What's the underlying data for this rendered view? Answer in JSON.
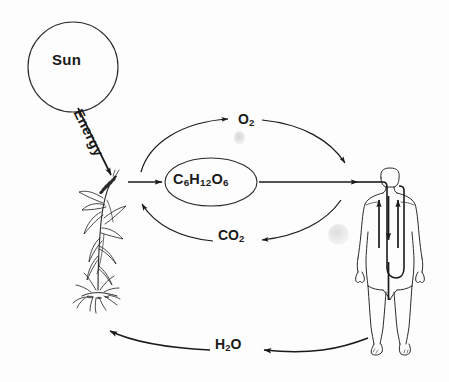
{
  "diagram": {
    "background_color": "#fdfdfd",
    "stroke_color": "#1a1a1a",
    "nodes": {
      "sun": {
        "label": "Sun",
        "shape": "circle",
        "cx": 73,
        "cy": 67,
        "r": 45
      },
      "plant": {
        "label": "plant",
        "shape": "illustration-wheat-plant",
        "x": 72,
        "y": 175,
        "width": 48,
        "height": 135
      },
      "glucose": {
        "label_text": "C",
        "sub1": "6",
        "mid1": "H",
        "sub2": "12",
        "mid2": "O",
        "sub3": "6",
        "full": "C6H12O6",
        "shape": "ellipse",
        "cx": 211,
        "cy": 182,
        "rx": 46,
        "ry": 24
      },
      "human": {
        "label": "human",
        "shape": "illustration-human-body",
        "x": 360,
        "y": 168,
        "width": 60,
        "height": 172
      }
    },
    "edges": [
      {
        "name": "sun-to-plant",
        "label": "Energy",
        "from": "sun",
        "to": "plant",
        "style": "straight-arrow",
        "direction": "down-right"
      },
      {
        "name": "plant-to-glucose",
        "label": "",
        "from": "plant",
        "to": "glucose",
        "style": "straight-arrow",
        "direction": "right"
      },
      {
        "name": "glucose-to-human",
        "label": "",
        "from": "glucose",
        "to": "human",
        "style": "straight-arrow",
        "direction": "right"
      },
      {
        "name": "oxygen-arc",
        "label": "O2",
        "from": "plant",
        "to": "human",
        "style": "curved-arc",
        "direction": "clockwise-upper"
      },
      {
        "name": "carbon-dioxide-arc",
        "label": "CO2",
        "from": "human",
        "to": "plant",
        "style": "curved-arc",
        "direction": "counterclockwise-lower"
      },
      {
        "name": "water-arc",
        "label": "H2O",
        "from": "human",
        "to": "plant",
        "style": "curved-arc",
        "direction": "right-to-left-bottom"
      }
    ],
    "labels": {
      "sun": "Sun",
      "energy": "Energy",
      "oxygen": {
        "base": "O",
        "sub": "2"
      },
      "carbon_dioxide": {
        "base": "CO",
        "sub": "2"
      },
      "water": {
        "base": "H",
        "sub": "2",
        "tail": "O"
      },
      "glucose": {
        "c": "C",
        "c_sub": "6",
        "h": "H",
        "h_sub": "12",
        "o": "O",
        "o_sub": "6"
      }
    },
    "artifacts": [
      {
        "name": "smudge-upper",
        "type": "scan-artifact"
      },
      {
        "name": "smudge-lower",
        "type": "scan-artifact"
      }
    ]
  }
}
